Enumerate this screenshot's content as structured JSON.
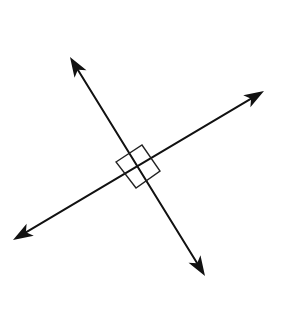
{
  "diagram": {
    "type": "perpendicular-lines",
    "background": "#ffffff",
    "stroke_color": "#111111",
    "intersection": {
      "x": 139,
      "y": 167
    },
    "lines": [
      {
        "name": "line-a",
        "start": {
          "x": 13,
          "y": 240
        },
        "end": {
          "x": 264,
          "y": 91
        },
        "arrows": "both"
      },
      {
        "name": "line-b",
        "start": {
          "x": 70,
          "y": 57
        },
        "end": {
          "x": 205,
          "y": 276
        },
        "arrows": "both"
      }
    ],
    "right_angle_marker": {
      "shape": "square",
      "corners": [
        {
          "x": 139,
          "y": 167
        },
        {
          "x": 116,
          "y": 162
        },
        {
          "x": 142,
          "y": 145
        },
        {
          "x": 160,
          "y": 171
        }
      ],
      "full_square": [
        {
          "x": 116,
          "y": 162
        },
        {
          "x": 142,
          "y": 145
        },
        {
          "x": 160,
          "y": 171
        },
        {
          "x": 136,
          "y": 188
        }
      ]
    }
  }
}
